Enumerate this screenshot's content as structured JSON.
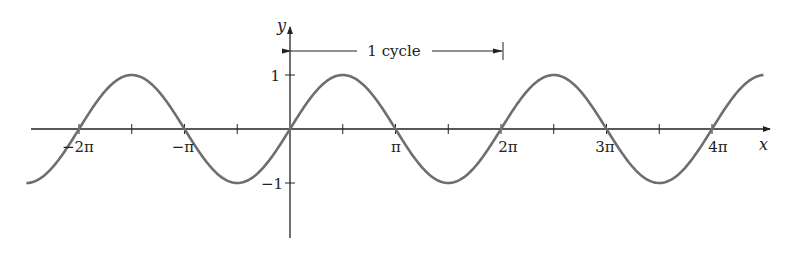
{
  "chart_data": {
    "type": "line",
    "title": "",
    "function": "y = sin x",
    "xlabel": "x",
    "ylabel": "y",
    "xlim": [
      -7.6,
      14.5
    ],
    "ylim": [
      -2.1,
      1.9
    ],
    "x_tick_labels": [
      "−2π",
      "−π",
      "π",
      "2π",
      "3π",
      "4π"
    ],
    "x_tick_values": [
      -6.2832,
      -3.1416,
      3.1416,
      6.2832,
      9.4248,
      12.5664
    ],
    "x_minor_ticks": [
      -4.7124,
      -1.5708,
      1.5708,
      4.7124,
      7.854,
      10.9956
    ],
    "y_tick_labels": [
      "1",
      "−1"
    ],
    "y_tick_values": [
      1,
      -1
    ],
    "grid": false,
    "legend": null,
    "annotations": [
      {
        "text": "1 cycle",
        "from_x": 0,
        "to_x": 6.2832,
        "type": "double-arrow-bracket"
      }
    ],
    "series": [
      {
        "name": "sin x",
        "color": "#6e6e6e",
        "x_range": [
          -7.85,
          14.1
        ]
      }
    ]
  },
  "labels": {
    "x_axis": "x",
    "y_axis": "y",
    "cycle": "1 cycle",
    "ticks_x": [
      "−2π",
      "−π",
      "π",
      "2π",
      "3π",
      "4π"
    ],
    "ticks_y": [
      "1",
      "−1"
    ]
  },
  "colors": {
    "curve": "#6e6e6e",
    "axis": "#222222"
  }
}
